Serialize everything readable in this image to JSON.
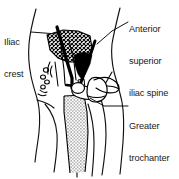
{
  "figure": {
    "kind": "anatomical-line-drawing",
    "background_color": "#ffffff",
    "ink_color": "#000000",
    "text_color": "#1a1a1a"
  },
  "labels": {
    "iliac_crest": {
      "line1": "Iliac",
      "line2": "crest"
    },
    "anterior_superior_iliac_spine": {
      "line1": "Anterior",
      "line2": "superior",
      "line3": "iliac spine"
    },
    "greater_trochanter": {
      "line1": "Greater",
      "line2": "trochanter"
    }
  },
  "structures": {
    "body_outline": "torso and thigh silhouette",
    "ilium": "cross-hatched wing of ilium",
    "pelvic_inlet": "solid black pelvic inlet shadow",
    "femur": "stippled femoral shaft",
    "femoral_head_neck": "femoral head and neck",
    "greater_trochanter_bone": "greater trochanter prominence",
    "pubic_rami": "pubic rami outline"
  },
  "leaders": {
    "iliac_crest_leader": "line from Iliac crest text to ilium crest",
    "asis_leader": "line from Anterior superior iliac spine text to the anterior superior iliac spine",
    "greater_trochanter_leader": "horizontal line from Greater trochanter text to trochanter"
  }
}
